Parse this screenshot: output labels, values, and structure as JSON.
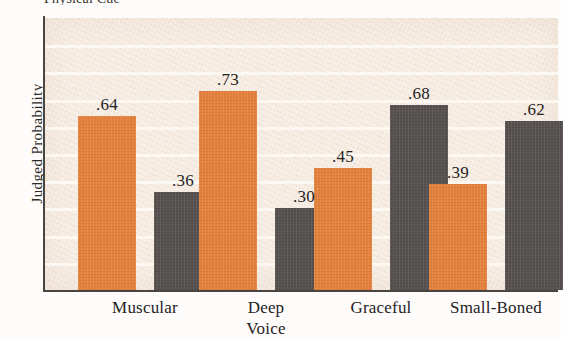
{
  "figure": {
    "top_caption_partial": "Physical Cue",
    "ylabel": "Judged Probability",
    "plot_background": "#F6ECE2",
    "gridline_color": "#FDF8F3",
    "axis_color": "#4A4540"
  },
  "chart_data": {
    "type": "bar",
    "title": "",
    "xlabel": "",
    "ylabel": "Judged Probability",
    "ylim": [
      0,
      1.0
    ],
    "grid": true,
    "legend": "none",
    "categories": [
      "Muscular",
      "Deep Voice",
      "Graceful",
      "Small-Boned"
    ],
    "category_lines": [
      [
        "Muscular"
      ],
      [
        "Deep",
        "Voice"
      ],
      [
        "Graceful"
      ],
      [
        "Small-Boned"
      ]
    ],
    "series": [
      {
        "name": "series-orange",
        "color": "#E8823C",
        "values": [
          0.64,
          0.73,
          0.45,
          0.39
        ],
        "labels": [
          ".64",
          ".73",
          ".45",
          ".39"
        ]
      },
      {
        "name": "series-dark",
        "color": "#55504D",
        "values": [
          0.36,
          0.3,
          0.68,
          0.62
        ],
        "labels": [
          ".36",
          ".30",
          ".68",
          ".62"
        ]
      }
    ]
  }
}
